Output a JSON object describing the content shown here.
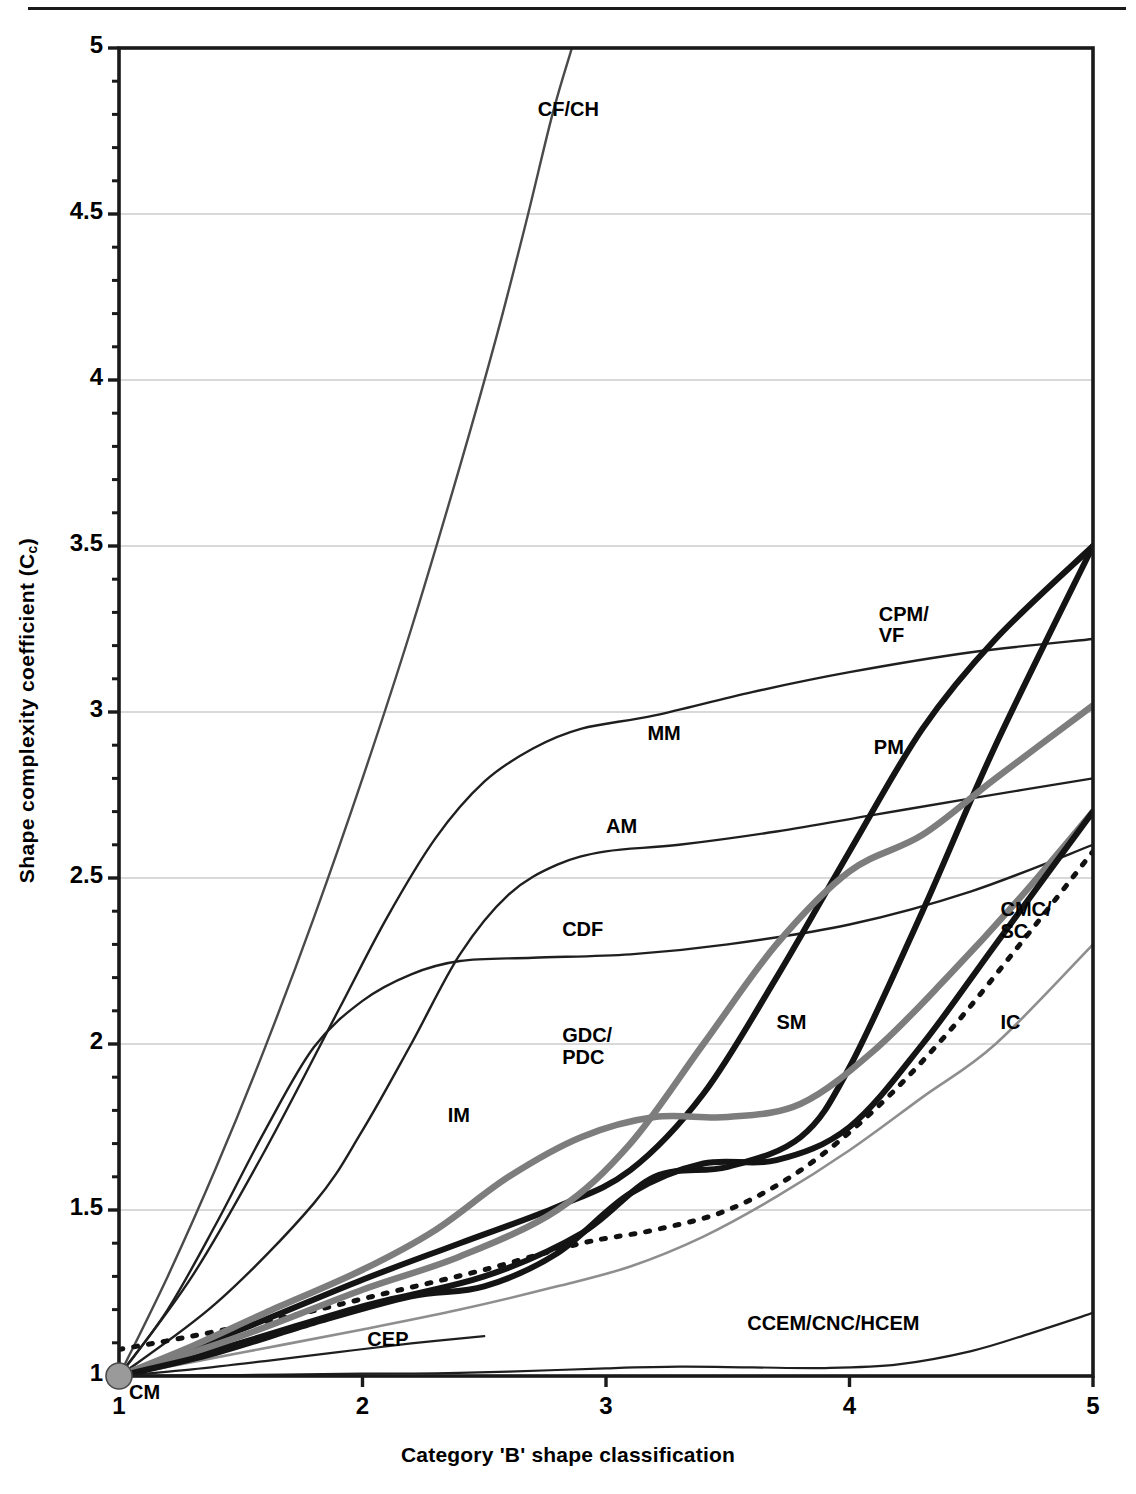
{
  "page": {
    "top_rule": true,
    "background": "#ffffff"
  },
  "axes": {
    "y_title": "Shape complexity coefficient (C",
    "y_title_sub": "c",
    "y_title_suffix": ")",
    "x_title": "Category 'B' shape classification",
    "y_ticks": [
      "1",
      "1.5",
      "2",
      "2.5",
      "3",
      "3.5",
      "4",
      "4.5",
      "5"
    ],
    "x_ticks": [
      "1",
      "2",
      "3",
      "4",
      "5"
    ],
    "xlim": [
      1,
      5
    ],
    "ylim": [
      1,
      5
    ],
    "grid": "horizontal-major-light"
  },
  "colors": {
    "axis": "#1a1a1a",
    "grid": "#b4b4b4",
    "thin_dark": "#1f1f1f",
    "thin_mid": "#4a4a4a",
    "thin_light": "#8e8e8e",
    "bold_dark": "#141414",
    "bold_gray": "#7d7d7d",
    "dotted": "#111111",
    "marker_fill": "#9a9a9a",
    "marker_stroke": "#4a4a4a"
  },
  "origin_marker": {
    "label": "CM",
    "x": 1,
    "y": 1,
    "radius_px": 13
  },
  "chart_data": {
    "type": "line",
    "title": "",
    "xlabel": "Category 'B' shape classification",
    "ylabel": "Shape complexity coefficient (Cc)",
    "xlim": [
      1,
      5
    ],
    "ylim": [
      1,
      5
    ],
    "x_ticks": [
      1,
      2,
      3,
      4,
      5
    ],
    "y_ticks": [
      1,
      1.5,
      2,
      2.5,
      3,
      3.5,
      4,
      4.5,
      5
    ],
    "grid": true,
    "legend": "inline-annotations",
    "series": [
      {
        "name": "CF/CH",
        "label": "CF/CH",
        "style": "thin",
        "color": "#4a4a4a",
        "width": 2.4,
        "dash": "none",
        "label_x": 2.72,
        "label_y": 4.81,
        "points": [
          [
            1.0,
            1.0
          ],
          [
            1.2,
            1.3
          ],
          [
            1.4,
            1.63
          ],
          [
            1.6,
            1.99
          ],
          [
            1.8,
            2.38
          ],
          [
            2.0,
            2.8
          ],
          [
            2.2,
            3.25
          ],
          [
            2.4,
            3.74
          ],
          [
            2.55,
            4.13
          ],
          [
            2.67,
            4.47
          ],
          [
            2.78,
            4.8
          ],
          [
            2.86,
            5.0
          ]
        ]
      },
      {
        "name": "MM",
        "label": "MM",
        "style": "thin",
        "color": "#1f1f1f",
        "width": 2.4,
        "dash": "none",
        "label_x": 3.17,
        "label_y": 2.93,
        "points": [
          [
            1.0,
            1.0
          ],
          [
            1.3,
            1.3
          ],
          [
            1.6,
            1.68
          ],
          [
            1.9,
            2.1
          ],
          [
            2.1,
            2.38
          ],
          [
            2.3,
            2.62
          ],
          [
            2.5,
            2.79
          ],
          [
            2.7,
            2.89
          ],
          [
            2.9,
            2.95
          ],
          [
            3.2,
            2.99
          ],
          [
            3.6,
            3.06
          ],
          [
            4.0,
            3.12
          ],
          [
            4.5,
            3.18
          ],
          [
            5.0,
            3.22
          ]
        ]
      },
      {
        "name": "AM",
        "label": "AM",
        "style": "thin",
        "color": "#1f1f1f",
        "width": 2.4,
        "dash": "none",
        "label_x": 3.0,
        "label_y": 2.65,
        "points": [
          [
            1.0,
            1.0
          ],
          [
            1.4,
            1.22
          ],
          [
            1.8,
            1.52
          ],
          [
            2.0,
            1.74
          ],
          [
            2.2,
            2.0
          ],
          [
            2.4,
            2.27
          ],
          [
            2.6,
            2.45
          ],
          [
            2.8,
            2.54
          ],
          [
            3.0,
            2.58
          ],
          [
            3.3,
            2.6
          ],
          [
            3.7,
            2.64
          ],
          [
            4.1,
            2.69
          ],
          [
            4.5,
            2.74
          ],
          [
            5.0,
            2.8
          ]
        ]
      },
      {
        "name": "CDF",
        "label": "CDF",
        "style": "thin",
        "color": "#1f1f1f",
        "width": 2.4,
        "dash": "none",
        "label_x": 2.82,
        "label_y": 2.34,
        "points": [
          [
            1.0,
            1.0
          ],
          [
            1.2,
            1.2
          ],
          [
            1.4,
            1.46
          ],
          [
            1.6,
            1.74
          ],
          [
            1.8,
            1.99
          ],
          [
            2.0,
            2.13
          ],
          [
            2.2,
            2.21
          ],
          [
            2.4,
            2.25
          ],
          [
            2.7,
            2.26
          ],
          [
            3.1,
            2.27
          ],
          [
            3.5,
            2.3
          ],
          [
            4.0,
            2.36
          ],
          [
            4.5,
            2.46
          ],
          [
            5.0,
            2.6
          ]
        ]
      },
      {
        "name": "CPM/VF",
        "label": "CPM/\nVF",
        "style": "bold",
        "color": "#141414",
        "width": 6.0,
        "dash": "none",
        "label_x": 4.12,
        "label_y": 3.29,
        "points": [
          [
            1.0,
            1.0
          ],
          [
            1.5,
            1.14
          ],
          [
            2.0,
            1.29
          ],
          [
            2.4,
            1.4
          ],
          [
            2.8,
            1.51
          ],
          [
            3.1,
            1.62
          ],
          [
            3.4,
            1.85
          ],
          [
            3.7,
            2.2
          ],
          [
            4.0,
            2.58
          ],
          [
            4.3,
            2.95
          ],
          [
            4.6,
            3.22
          ],
          [
            5.0,
            3.5
          ]
        ]
      },
      {
        "name": "PM",
        "label": "PM",
        "style": "bold",
        "color": "#141414",
        "width": 6.0,
        "dash": "none",
        "label_x": 4.1,
        "label_y": 2.89,
        "points": [
          [
            1.0,
            1.0
          ],
          [
            1.5,
            1.1
          ],
          [
            2.0,
            1.21
          ],
          [
            2.5,
            1.3
          ],
          [
            2.9,
            1.43
          ],
          [
            3.2,
            1.6
          ],
          [
            3.5,
            1.63
          ],
          [
            3.8,
            1.72
          ],
          [
            4.0,
            1.93
          ],
          [
            4.3,
            2.4
          ],
          [
            4.6,
            2.9
          ],
          [
            5.0,
            3.5
          ]
        ]
      },
      {
        "name": "GDC/PDC",
        "label": "GDC/\nPDC",
        "style": "bold",
        "color": "#7d7d7d",
        "width": 6.5,
        "dash": "none",
        "label_x": 2.82,
        "label_y": 2.02,
        "points": [
          [
            1.0,
            1.0
          ],
          [
            1.5,
            1.12
          ],
          [
            2.0,
            1.26
          ],
          [
            2.4,
            1.36
          ],
          [
            2.8,
            1.5
          ],
          [
            3.1,
            1.7
          ],
          [
            3.4,
            2.0
          ],
          [
            3.7,
            2.3
          ],
          [
            4.0,
            2.52
          ],
          [
            4.3,
            2.63
          ],
          [
            4.6,
            2.8
          ],
          [
            5.0,
            3.02
          ]
        ]
      },
      {
        "name": "IM",
        "label": "IM",
        "style": "bold",
        "color": "#7d7d7d",
        "width": 6.5,
        "dash": "none",
        "label_x": 2.35,
        "label_y": 1.78,
        "points": [
          [
            1.0,
            1.0
          ],
          [
            1.3,
            1.09
          ],
          [
            1.6,
            1.19
          ],
          [
            2.0,
            1.32
          ],
          [
            2.3,
            1.44
          ],
          [
            2.6,
            1.6
          ],
          [
            2.9,
            1.72
          ],
          [
            3.2,
            1.78
          ],
          [
            3.5,
            1.78
          ],
          [
            3.8,
            1.82
          ],
          [
            4.1,
            1.98
          ],
          [
            4.4,
            2.2
          ],
          [
            4.7,
            2.44
          ],
          [
            5.0,
            2.7
          ]
        ]
      },
      {
        "name": "SM",
        "label": "SM",
        "style": "bold",
        "color": "#141414",
        "width": 6.0,
        "dash": "none",
        "label_x": 3.7,
        "label_y": 2.06,
        "points": [
          [
            1.0,
            1.0
          ],
          [
            1.4,
            1.07
          ],
          [
            1.8,
            1.16
          ],
          [
            2.2,
            1.24
          ],
          [
            2.5,
            1.27
          ],
          [
            2.8,
            1.37
          ],
          [
            3.1,
            1.55
          ],
          [
            3.4,
            1.64
          ],
          [
            3.7,
            1.65
          ],
          [
            4.0,
            1.75
          ],
          [
            4.3,
            2.0
          ],
          [
            4.6,
            2.3
          ],
          [
            5.0,
            2.7
          ]
        ]
      },
      {
        "name": "CMC/SC",
        "label": "CMC/\nSC",
        "style": "dotted",
        "color": "#111111",
        "width": 5.0,
        "dash": "4 11",
        "label_x": 4.62,
        "label_y": 2.4,
        "points": [
          [
            1.0,
            1.08
          ],
          [
            1.3,
            1.12
          ],
          [
            1.7,
            1.18
          ],
          [
            2.1,
            1.25
          ],
          [
            2.5,
            1.32
          ],
          [
            2.9,
            1.4
          ],
          [
            3.2,
            1.44
          ],
          [
            3.5,
            1.5
          ],
          [
            3.8,
            1.62
          ],
          [
            4.1,
            1.8
          ],
          [
            4.4,
            2.03
          ],
          [
            4.7,
            2.3
          ],
          [
            5.0,
            2.58
          ]
        ]
      },
      {
        "name": "IC",
        "label": "IC",
        "style": "thin",
        "color": "#8e8e8e",
        "width": 2.6,
        "dash": "none",
        "label_x": 4.62,
        "label_y": 2.06,
        "points": [
          [
            1.0,
            1.0
          ],
          [
            1.5,
            1.07
          ],
          [
            2.0,
            1.14
          ],
          [
            2.4,
            1.2
          ],
          [
            2.8,
            1.27
          ],
          [
            3.1,
            1.33
          ],
          [
            3.4,
            1.42
          ],
          [
            3.7,
            1.54
          ],
          [
            4.0,
            1.68
          ],
          [
            4.3,
            1.84
          ],
          [
            4.6,
            2.0
          ],
          [
            5.0,
            2.3
          ]
        ]
      },
      {
        "name": "CEP",
        "label": "CEP",
        "style": "thin",
        "color": "#1f1f1f",
        "width": 2.2,
        "dash": "none",
        "label_x": 2.02,
        "label_y": 1.105,
        "points": [
          [
            1.0,
            1.0
          ],
          [
            1.3,
            1.02
          ],
          [
            1.6,
            1.045
          ],
          [
            1.9,
            1.072
          ],
          [
            2.2,
            1.098
          ],
          [
            2.5,
            1.12
          ]
        ]
      },
      {
        "name": "CCEM/CNC/HCEM",
        "label": "CCEM/CNC/HCEM",
        "style": "thin",
        "color": "#1f1f1f",
        "width": 2.2,
        "dash": "none",
        "label_x": 3.58,
        "label_y": 1.155,
        "points": [
          [
            1.0,
            1.0
          ],
          [
            1.5,
            1.003
          ],
          [
            2.0,
            1.007
          ],
          [
            2.3,
            1.008
          ],
          [
            2.6,
            1.013
          ],
          [
            3.0,
            1.023
          ],
          [
            3.3,
            1.028
          ],
          [
            3.6,
            1.026
          ],
          [
            3.9,
            1.024
          ],
          [
            4.2,
            1.035
          ],
          [
            4.5,
            1.075
          ],
          [
            4.75,
            1.13
          ],
          [
            5.0,
            1.19
          ]
        ]
      }
    ]
  }
}
